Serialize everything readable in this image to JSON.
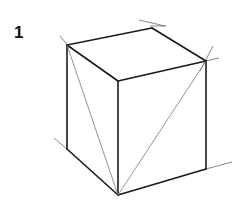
{
  "figure": {
    "label": "1",
    "stroke_color": "#1a1a1a",
    "guide_color": "#777777"
  }
}
